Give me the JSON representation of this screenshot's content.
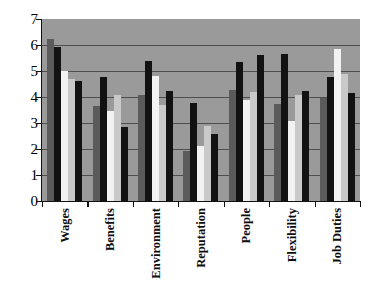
{
  "chart_data": {
    "type": "bar",
    "title": "",
    "subtitle": "",
    "xlabel": "",
    "ylabel": "",
    "ylim": [
      0,
      7
    ],
    "yticks": [
      0,
      1,
      2,
      3,
      4,
      5,
      6,
      7
    ],
    "grid": true,
    "gridlines_at": [
      1,
      2,
      3,
      4,
      5,
      6
    ],
    "legend": "none",
    "legend_position": "none",
    "plot_background": "#9a9a9a",
    "categories": [
      "Wages",
      "Benefits",
      "Environment",
      "Reputation",
      "People",
      "Flexibility",
      "Job Duties"
    ],
    "series": [
      {
        "name": "Series 1",
        "color": "#5b5b5b",
        "values": [
          6.22,
          3.65,
          4.08,
          1.93,
          4.28,
          3.73,
          3.95
        ]
      },
      {
        "name": "Series 2",
        "color": "#121212",
        "values": [
          5.93,
          4.78,
          5.38,
          3.78,
          5.33,
          5.67,
          4.78
        ]
      },
      {
        "name": "Series 3",
        "color": "#f2f2f2",
        "values": [
          4.99,
          3.45,
          4.79,
          2.13,
          3.9,
          3.08,
          5.83
        ]
      },
      {
        "name": "Series 4",
        "color": "#c9c9c9",
        "values": [
          4.68,
          4.08,
          3.7,
          2.88,
          4.2,
          4.07,
          4.9
        ]
      },
      {
        "name": "Series 5",
        "color": "#121212",
        "values": [
          4.6,
          2.85,
          4.25,
          2.58,
          5.6,
          4.24,
          4.17
        ]
      }
    ]
  }
}
